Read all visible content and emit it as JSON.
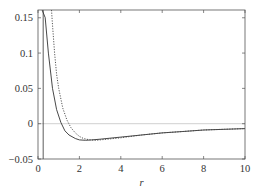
{
  "chart_data": {
    "type": "line",
    "title": "",
    "xlabel": "r",
    "ylabel": "",
    "xlim": [
      0,
      10
    ],
    "ylim": [
      -0.05,
      0.161
    ],
    "xticks": [
      0,
      2,
      4,
      6,
      8,
      10
    ],
    "xtick_labels": [
      "0",
      "2",
      "4",
      "6",
      "8",
      "10"
    ],
    "yticks": [
      -0.05,
      0,
      0.05,
      0.1,
      0.15
    ],
    "ytick_labels": [
      "−0.05",
      "0",
      "0.05",
      "0.1",
      "0.15"
    ],
    "grid": false,
    "legend": null,
    "reference_lines": [
      {
        "orientation": "horizontal",
        "y": 0,
        "style": "thin light gray"
      }
    ],
    "series": [
      {
        "name": "solid curve",
        "style": "solid",
        "x": [
          0.1,
          0.12,
          0.25,
          0.35,
          0.5,
          0.7,
          0.9,
          1.1,
          1.3,
          1.5,
          1.8,
          2.0,
          2.3,
          2.6,
          3.0,
          4.0,
          5.0,
          6.0,
          7.0,
          8.0,
          9.0,
          10.0
        ],
        "y": [
          0.161,
          -0.05,
          0.1,
          0.15,
          0.1,
          0.05,
          0.02,
          0.002,
          -0.01,
          -0.016,
          -0.021,
          -0.023,
          -0.0235,
          -0.023,
          -0.022,
          -0.019,
          -0.016,
          -0.013,
          -0.011,
          -0.009,
          -0.008,
          -0.007
        ]
      },
      {
        "name": "dotted curve",
        "style": "dotted",
        "x": [
          0.65,
          0.7,
          0.8,
          0.9,
          1.0,
          1.2,
          1.4,
          1.6,
          1.8,
          2.0,
          2.2,
          2.5,
          2.8,
          3.0,
          4.0,
          5.0,
          6.0,
          7.0,
          8.0,
          9.0,
          10.0
        ],
        "y": [
          0.161,
          0.14,
          0.1,
          0.07,
          0.05,
          0.022,
          0.005,
          -0.006,
          -0.013,
          -0.018,
          -0.021,
          -0.023,
          -0.0235,
          -0.023,
          -0.02,
          -0.016,
          -0.013,
          -0.011,
          -0.009,
          -0.008,
          -0.007
        ]
      }
    ]
  },
  "plot_area": {
    "left": 38,
    "right": 245,
    "top": 10,
    "bottom": 159
  },
  "colors": {
    "axis": "#555555",
    "solid_line": "#333333",
    "dotted_line": "#444444",
    "zero_line": "#bbbbbb"
  }
}
